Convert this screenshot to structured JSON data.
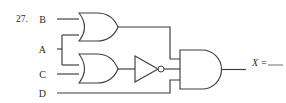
{
  "page": {
    "background_color": "#ffffff",
    "ink_color": "#3a3a3a",
    "width": 286,
    "height": 103
  },
  "problem": {
    "number_label": "27.",
    "answer_prompt": "X =",
    "answer_blank": "____"
  },
  "inputs": [
    {
      "name": "input-b",
      "label": "B",
      "x": 47,
      "y": 19
    },
    {
      "name": "input-a",
      "label": "A",
      "x": 47,
      "y": 49
    },
    {
      "name": "input-c",
      "label": "C",
      "x": 47,
      "y": 74
    },
    {
      "name": "input-d",
      "label": "D",
      "x": 47,
      "y": 93
    }
  ],
  "gates": [
    {
      "name": "or-gate-1",
      "type": "OR",
      "inputs": [
        "B",
        "A"
      ],
      "output_to": "and-gate-output",
      "x": 79,
      "y": 13,
      "w": 39,
      "h": 29
    },
    {
      "name": "or-gate-2",
      "type": "OR",
      "inputs": [
        "A",
        "C"
      ],
      "output_to": "not-gate-1",
      "x": 79,
      "y": 54,
      "w": 39,
      "h": 29
    },
    {
      "name": "not-gate-1",
      "type": "NOT",
      "inputs": [
        "or-gate-2"
      ],
      "output_to": "and-gate-output",
      "x": 135,
      "y": 56,
      "w": 26,
      "h": 23
    },
    {
      "name": "and-gate-output",
      "type": "AND",
      "inputs": [
        "or-gate-1",
        "not-gate-1",
        "D"
      ],
      "output_to": "X",
      "x": 180,
      "y": 50,
      "w": 44,
      "h": 39
    }
  ],
  "wires": [
    {
      "name": "wire-b-to-or1",
      "from": "B",
      "to": "or-gate-1.in1"
    },
    {
      "name": "wire-a-fanout",
      "from": "A",
      "to": "or-gate-1.in2 / or-gate-2.in1"
    },
    {
      "name": "wire-c-to-or2",
      "from": "C",
      "to": "or-gate-2.in2"
    },
    {
      "name": "wire-or2-to-not",
      "from": "or-gate-2.out",
      "to": "not-gate-1.in"
    },
    {
      "name": "wire-or1-to-and",
      "from": "or-gate-1.out",
      "to": "and-gate-output.in1"
    },
    {
      "name": "wire-not-to-and",
      "from": "not-gate-1.out",
      "to": "and-gate-output.in2"
    },
    {
      "name": "wire-d-to-and",
      "from": "D",
      "to": "and-gate-output.in3"
    },
    {
      "name": "wire-and-to-x",
      "from": "and-gate-output.out",
      "to": "X"
    }
  ],
  "junctions": [
    {
      "name": "junction-a-split",
      "x": 62,
      "y": 49
    }
  ]
}
